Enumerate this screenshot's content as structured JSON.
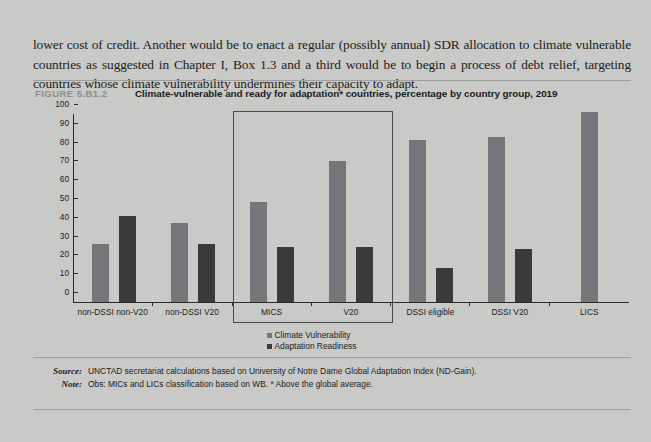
{
  "body": {
    "paragraph": "lower cost of credit. Another would be to enact a regular (possibly annual) SDR allocation to climate vulnerable countries as suggested in  Chapter I, Box 1.3 and a third would be to begin a process of debt relief, targeting countries whose climate vulnerability undermines their capacity to adapt."
  },
  "figure": {
    "number": "FIGURE 5.B1.2",
    "title": "Climate-vulnerable and ready for adaptation* countries, percentage by country group, 2019"
  },
  "footnotes": {
    "source_label": "Source:",
    "source_text": "UNCTAD secretariat calculations based on University of Notre Dame Global Adaptation Index (ND-Gain).",
    "note_label": "Note:",
    "note_text": "Obs: MICs and LICs classification based on WB. * Above the global average."
  },
  "colors": {
    "page_background": "#c9c9c7",
    "climate_vulnerability": "#76767a",
    "adaptation_readiness": "#3a3a3c",
    "axis": "#2a2a2a",
    "figure_number": "#8e8e8c",
    "highlight_border": "#4a4a4a"
  },
  "chart_data": {
    "type": "bar",
    "title": "Climate-vulnerable and ready for adaptation* countries, percentage by country group, 2019",
    "xlabel": "",
    "ylabel": "",
    "ylim": [
      0,
      100
    ],
    "yticks": [
      0,
      10,
      20,
      30,
      40,
      50,
      60,
      70,
      80,
      90,
      100
    ],
    "grid": false,
    "legend_position": "bottom-center",
    "categories": [
      "non-DSSI non-V20",
      "non-DSSI V20",
      "MICS",
      "V20",
      "DSSI eligible",
      "DSSI V20",
      "LICS"
    ],
    "series": [
      {
        "name": "Climate Vulnerability",
        "color": "#76767a",
        "values": [
          31,
          42,
          53,
          75,
          86,
          88,
          101
        ]
      },
      {
        "name": "Adaptation Readiness",
        "color": "#3a3a3c",
        "values": [
          46,
          31,
          29,
          29,
          18,
          28,
          null
        ]
      }
    ],
    "annotations": [
      {
        "type": "highlight-box",
        "covers": [
          "MICS",
          "V20"
        ]
      }
    ]
  }
}
